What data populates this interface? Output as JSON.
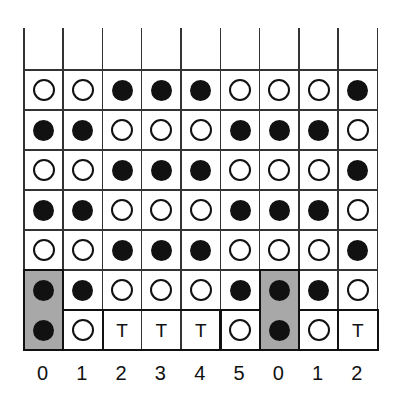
{
  "diagram": {
    "columns": 9,
    "rows": 7,
    "cell_width": 39.3,
    "cell_height": 40,
    "header_row_height": 41,
    "column_labels": [
      "0",
      "1",
      "2",
      "3",
      "4",
      "5",
      "0",
      "1",
      "2"
    ],
    "legend": {
      "filled": "filled-circle",
      "open": "open-circle",
      "T": "T"
    },
    "grid": [
      [
        "O",
        "O",
        "F",
        "F",
        "F",
        "O",
        "O",
        "O",
        "F"
      ],
      [
        "F",
        "F",
        "O",
        "O",
        "O",
        "F",
        "F",
        "F",
        "O"
      ],
      [
        "O",
        "O",
        "F",
        "F",
        "F",
        "O",
        "O",
        "O",
        "F"
      ],
      [
        "F",
        "F",
        "O",
        "O",
        "O",
        "F",
        "F",
        "F",
        "O"
      ],
      [
        "O",
        "O",
        "F",
        "F",
        "F",
        "O",
        "O",
        "O",
        "F"
      ],
      [
        "F",
        "F",
        "O",
        "O",
        "O",
        "F",
        "F",
        "F",
        "O"
      ],
      [
        "F",
        "O",
        "T",
        "T",
        "T",
        "O",
        "F",
        "O",
        "T"
      ]
    ],
    "gray_cells": [
      [
        5,
        0
      ],
      [
        6,
        0
      ],
      [
        5,
        6
      ],
      [
        6,
        6
      ]
    ],
    "bold_boxes": [
      {
        "row_start": 5,
        "row_end": 6,
        "col_start": 0,
        "col_end": 0
      },
      {
        "row_start": 6,
        "row_end": 6,
        "col_start": 1,
        "col_end": 1
      },
      {
        "row_start": 6,
        "row_end": 6,
        "col_start": 2,
        "col_end": 4
      },
      {
        "row_start": 6,
        "row_end": 6,
        "col_start": 5,
        "col_end": 5
      },
      {
        "row_start": 5,
        "row_end": 6,
        "col_start": 6,
        "col_end": 6
      },
      {
        "row_start": 6,
        "row_end": 6,
        "col_start": 7,
        "col_end": 7
      },
      {
        "row_start": 6,
        "row_end": 6,
        "col_start": 8,
        "col_end": 8
      }
    ],
    "colors": {
      "line": "#333333",
      "dot": "#111111",
      "gray": "#a8a8a8",
      "background": "#ffffff"
    }
  }
}
